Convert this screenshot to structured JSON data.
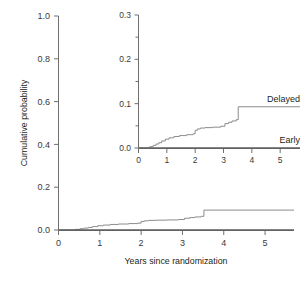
{
  "chart_data": {
    "type": "line",
    "title": "",
    "subtitle": "",
    "xlabel": "Years since randomization",
    "ylabel": "Cumulative probability",
    "xlim": [
      0,
      5.7
    ],
    "ylim": [
      0,
      1.0
    ],
    "grid": false,
    "legend_position": "inline-right-of-curves-in-inset",
    "xticks": [
      "0",
      "1",
      "2",
      "3",
      "4",
      "5"
    ],
    "xtick_values": [
      0,
      1,
      2,
      3,
      4,
      5
    ],
    "yticks": [
      "0.0",
      "0.2",
      "0.4",
      "0.6",
      "0.8",
      "1.0"
    ],
    "ytick_values": [
      0.0,
      0.2,
      0.4,
      0.6,
      0.8,
      1.0
    ],
    "series": [
      {
        "name": "Delayed",
        "step": "post",
        "x": [
          0,
          0.4,
          0.52,
          0.62,
          0.72,
          0.82,
          0.95,
          1.08,
          1.25,
          1.45,
          1.7,
          1.92,
          2.0,
          2.08,
          2.18,
          2.35,
          2.62,
          2.9,
          3.05,
          3.18,
          3.3,
          3.45,
          3.52,
          5.7
        ],
        "y": [
          0.0,
          0.003,
          0.006,
          0.009,
          0.012,
          0.016,
          0.02,
          0.023,
          0.026,
          0.028,
          0.03,
          0.032,
          0.04,
          0.043,
          0.045,
          0.046,
          0.047,
          0.049,
          0.055,
          0.058,
          0.061,
          0.064,
          0.093,
          0.093
        ]
      },
      {
        "name": "Early",
        "step": "post",
        "x": [
          0,
          5.7
        ],
        "y": [
          0.0,
          0.0
        ]
      }
    ],
    "inset": {
      "type": "line",
      "xlabel": "",
      "ylabel": "",
      "xlim": [
        0,
        5.7
      ],
      "ylim": [
        0,
        0.3
      ],
      "grid": false,
      "xticks": [
        "0",
        "1",
        "2",
        "3",
        "4",
        "5"
      ],
      "xtick_values": [
        0,
        1,
        2,
        3,
        4,
        5
      ],
      "yticks": [
        "0.0",
        "0.1",
        "0.2",
        "0.3"
      ],
      "ytick_values": [
        0.0,
        0.1,
        0.2,
        0.3
      ],
      "yminor_tick_values": [
        0.05,
        0.15,
        0.25
      ],
      "series": [
        {
          "name": "Delayed",
          "label": "Delayed",
          "step": "post",
          "x": [
            0,
            0.4,
            0.52,
            0.62,
            0.72,
            0.82,
            0.95,
            1.08,
            1.25,
            1.45,
            1.7,
            1.92,
            2.0,
            2.08,
            2.18,
            2.35,
            2.62,
            2.9,
            3.05,
            3.18,
            3.3,
            3.45,
            3.52,
            5.7
          ],
          "y": [
            0.0,
            0.003,
            0.006,
            0.009,
            0.012,
            0.016,
            0.02,
            0.023,
            0.026,
            0.028,
            0.03,
            0.032,
            0.04,
            0.043,
            0.045,
            0.046,
            0.047,
            0.049,
            0.055,
            0.058,
            0.061,
            0.064,
            0.093,
            0.093
          ]
        },
        {
          "name": "Early",
          "label": "Early",
          "step": "post",
          "x": [
            0,
            5.7
          ],
          "y": [
            0.0,
            0.0
          ]
        }
      ]
    },
    "colors": {
      "delayed": "#8c8c8c",
      "early": "#5d5d5d",
      "axis": "#6f6f6f",
      "text": "#231f20",
      "background": "#ffffff"
    }
  },
  "labels": {
    "ylabel": "Cumulative probability",
    "xlabel": "Years since randomization",
    "delayed": "Delayed",
    "early": "Early"
  }
}
